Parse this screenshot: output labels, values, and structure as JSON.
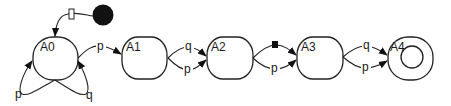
{
  "diagram": {
    "type": "state-machine",
    "initial": {
      "label": "",
      "marker": "filled-circle",
      "color": "#111111"
    },
    "states": [
      {
        "id": "A0",
        "label": "A0",
        "accepting": false
      },
      {
        "id": "A1",
        "label": "A1",
        "accepting": false
      },
      {
        "id": "A2",
        "label": "A2",
        "accepting": false
      },
      {
        "id": "A3",
        "label": "A3",
        "accepting": false
      },
      {
        "id": "A4",
        "label": "A4",
        "accepting": true
      }
    ],
    "transitions": [
      {
        "from": "initial",
        "to": "A0",
        "label": "",
        "marker": "open-rectangle"
      },
      {
        "from": "A0",
        "to": "A0",
        "label": "p"
      },
      {
        "from": "A0",
        "to": "A0",
        "label": "q"
      },
      {
        "from": "A0",
        "to": "A1",
        "label": "p"
      },
      {
        "from": "A1",
        "to": "A2",
        "label": "q"
      },
      {
        "from": "A1",
        "to": "A2",
        "label": "p"
      },
      {
        "from": "A2",
        "to": "A3",
        "label": "",
        "marker": "filled-square"
      },
      {
        "from": "A2",
        "to": "A3",
        "label": "p"
      },
      {
        "from": "A3",
        "to": "A4",
        "label": "q"
      },
      {
        "from": "A3",
        "to": "A4",
        "label": "p"
      }
    ],
    "labels": {
      "a0": "A0",
      "a1": "A1",
      "a2": "A2",
      "a3": "A3",
      "a4": "A4",
      "self_p": "p",
      "self_q": "q",
      "a0_a1": "p",
      "a1_a2_top": "q",
      "a1_a2_bottom": "p",
      "a2_a3_bottom": "p",
      "a3_a4_top": "q",
      "a3_a4_bottom": "p"
    }
  }
}
